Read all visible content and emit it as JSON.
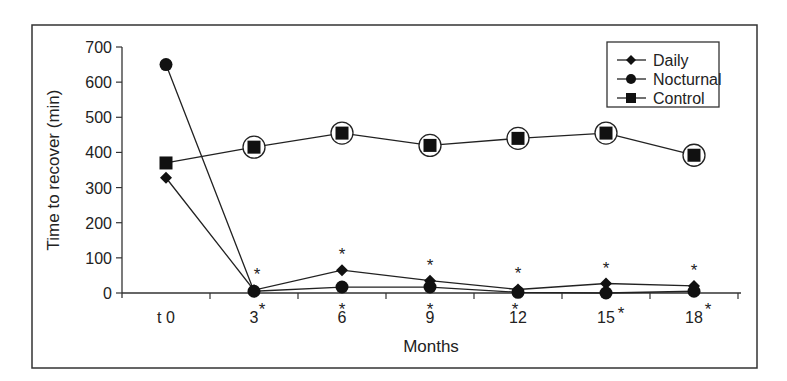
{
  "chart_data": {
    "type": "line",
    "title": "",
    "xlabel": "Months",
    "ylabel": "Time to recover (min)",
    "categories": [
      "t 0",
      "3",
      "6",
      "9",
      "12",
      "15",
      "18"
    ],
    "ylim": [
      0,
      700
    ],
    "yticks": [
      0,
      100,
      200,
      300,
      400,
      500,
      600,
      700
    ],
    "grid": false,
    "legend_position": "upper right, inside",
    "series": [
      {
        "name": "Daily",
        "marker": "diamond",
        "values": [
          328,
          8,
          65,
          35,
          10,
          27,
          20
        ]
      },
      {
        "name": "Nocturnal",
        "marker": "circle",
        "values": [
          650,
          5,
          17,
          17,
          2,
          0,
          5
        ]
      },
      {
        "name": "Control",
        "marker": "square",
        "values": [
          370,
          415,
          455,
          420,
          440,
          455,
          392
        ],
        "annotation": "open circles around Control markers at months 3–18"
      }
    ],
    "annotations": [
      {
        "text": "*",
        "note": "asterisk above Daily markers at months 3, 6, 9, 12, 15, 18"
      },
      {
        "text": "*",
        "note": "asterisk below Nocturnal markers at months 3, 6, 9, 12, 15, 18"
      }
    ]
  },
  "frame": {
    "x": 32,
    "y": 25,
    "w": 725,
    "h": 343
  },
  "plot": {
    "x0": 122,
    "y0": 293,
    "y700": 47,
    "xend": 741,
    "step": 88
  }
}
